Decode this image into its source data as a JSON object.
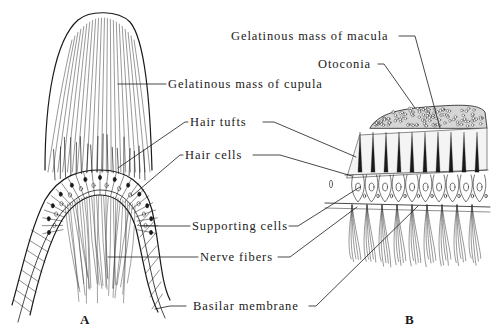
{
  "figure": {
    "panels": [
      {
        "id": "A",
        "label": "A",
        "subject": "Crista ampullaris (cupula)"
      },
      {
        "id": "B",
        "label": "B",
        "subject": "Macula (otolith organ)"
      }
    ],
    "labels": {
      "gelatinous_cupula": "Gelatinous mass of cupula",
      "hair_tufts": "Hair tufts",
      "hair_cells": "Hair cells",
      "supporting_cells": "Supporting cells",
      "nerve_fibers": "Nerve fibers",
      "basilar_membrane": "Basilar membrane",
      "gelatinous_macula": "Gelatinous mass of macula",
      "otoconia": "Otoconia"
    },
    "colors": {
      "ink": "#1a1a1a",
      "background": "#ffffff"
    }
  }
}
